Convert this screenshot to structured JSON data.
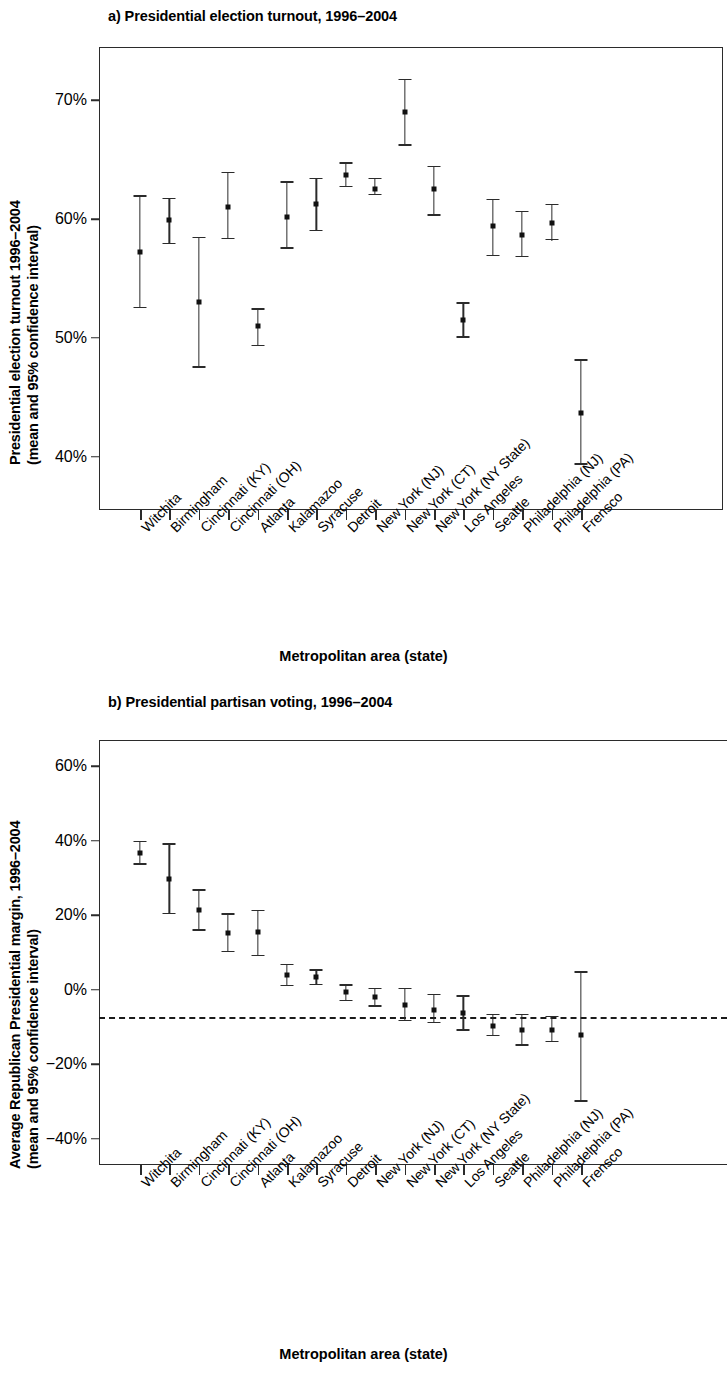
{
  "figure": {
    "categories": [
      "Witchita",
      "Birmingham",
      "Cincinnati (KY)",
      "Cincinnati (OH)",
      "Atlanta",
      "Kalamazoo",
      "Syracuse",
      "Detroit",
      "New York (NJ)",
      "New York (CT)",
      "New York (NY State)",
      "Los Angeles",
      "Seattle",
      "Philadelphia (NJ)",
      "Philadelphia (PA)",
      "Frensco"
    ],
    "xlabel": "Metropolitan area (state)"
  },
  "panel_a": {
    "title": "a) Presidential election turnout, 1996–2004",
    "ylabel_line1": "Presidential election turnout 1996–2004",
    "ylabel_line2": "(mean and 95% confidence interval)",
    "xlabel": "Metropolitan area (state)",
    "yticks": [
      "70%",
      "60%",
      "50%",
      "40%"
    ]
  },
  "panel_b": {
    "title": "b) Presidential partisan voting, 1996–2004",
    "ylabel_line1": "Average Republican Presidential margin, 1996–2004",
    "ylabel_line2": "(mean and 95% confidence interval)",
    "xlabel": "Metropolitan area (state)",
    "yticks": [
      "60%",
      "40%",
      "20%",
      "0%",
      "−20%",
      "−40%"
    ]
  },
  "chart_data": [
    {
      "type": "scatter",
      "panel": "a",
      "title": "a) Presidential election turnout, 1996–2004",
      "xlabel": "Metropolitan area (state)",
      "ylabel": "Presidential election turnout 1996–2004 (mean and 95% confidence interval)",
      "ylim": [
        35.5,
        74.5
      ],
      "ytick_values": [
        70,
        60,
        50,
        40
      ],
      "ytick_labels": [
        "70%",
        "60%",
        "50%",
        "40%"
      ],
      "grid": false,
      "legend": null,
      "error_bars": "95% confidence interval",
      "categories": [
        "Witchita",
        "Birmingham",
        "Cincinnati (KY)",
        "Cincinnati (OH)",
        "Atlanta",
        "Kalamazoo",
        "Syracuse",
        "Detroit",
        "New York (NJ)",
        "New York (CT)",
        "New York (NY State)",
        "Los Angeles",
        "Seattle",
        "Philadelphia (NJ)",
        "Philadelphia (PA)",
        "Frensco"
      ],
      "mean": [
        57.2,
        59.9,
        53.0,
        61.0,
        51.0,
        60.2,
        61.3,
        63.7,
        62.5,
        69.0,
        62.5,
        51.5,
        59.4,
        58.7,
        59.7,
        43.7
      ],
      "ci_low": [
        52.5,
        57.9,
        47.5,
        58.3,
        49.3,
        57.5,
        59.0,
        62.7,
        62.0,
        66.2,
        60.3,
        50.0,
        56.9,
        56.8,
        58.2,
        39.3
      ],
      "ci_high": [
        62.0,
        61.8,
        58.5,
        64.0,
        52.5,
        63.2,
        63.5,
        64.8,
        63.5,
        71.8,
        64.5,
        53.0,
        61.7,
        60.7,
        61.3,
        48.2
      ],
      "units": "percent"
    },
    {
      "type": "scatter",
      "panel": "b",
      "title": "b) Presidential partisan voting, 1996–2004",
      "xlabel": "Metropolitan area (state)",
      "ylabel": "Average Republican Presidential margin, 1996–2004 (mean and 95% confidence interval)",
      "ylim": [
        -47,
        67
      ],
      "ytick_values": [
        60,
        40,
        20,
        0,
        -20,
        -40
      ],
      "ytick_labels": [
        "60%",
        "40%",
        "20%",
        "0%",
        "−20%",
        "−40%"
      ],
      "grid": false,
      "legend": null,
      "reference_line": {
        "y": 0,
        "style": "dashed"
      },
      "error_bars": "95% confidence interval",
      "categories": [
        "Witchita",
        "Birmingham",
        "Cincinnati (KY)",
        "Cincinnati (OH)",
        "Atlanta",
        "Kalamazoo",
        "Syracuse",
        "Detroit",
        "New York (NJ)",
        "New York (CT)",
        "New York (NY State)",
        "Los Angeles",
        "Seattle",
        "Philadelphia (NJ)",
        "Philadelphia (PA)",
        "Frensco"
      ],
      "mean": [
        36.8,
        29.7,
        21.3,
        15.3,
        15.5,
        4.0,
        3.3,
        -0.5,
        -2.0,
        -4.0,
        -5.3,
        -6.2,
        -9.8,
        -10.8,
        -10.8,
        -12.0
      ],
      "ci_low": [
        33.5,
        20.3,
        15.8,
        10.0,
        9.0,
        1.0,
        1.3,
        -3.0,
        -4.5,
        -8.5,
        -9.0,
        -11.0,
        -12.5,
        -15.0,
        -14.0,
        -30.0
      ],
      "ci_high": [
        40.0,
        39.3,
        27.0,
        20.5,
        21.5,
        7.0,
        5.5,
        1.5,
        0.5,
        0.5,
        -1.0,
        -1.5,
        -6.5,
        -6.5,
        -7.0,
        5.0
      ],
      "units": "percent"
    }
  ]
}
